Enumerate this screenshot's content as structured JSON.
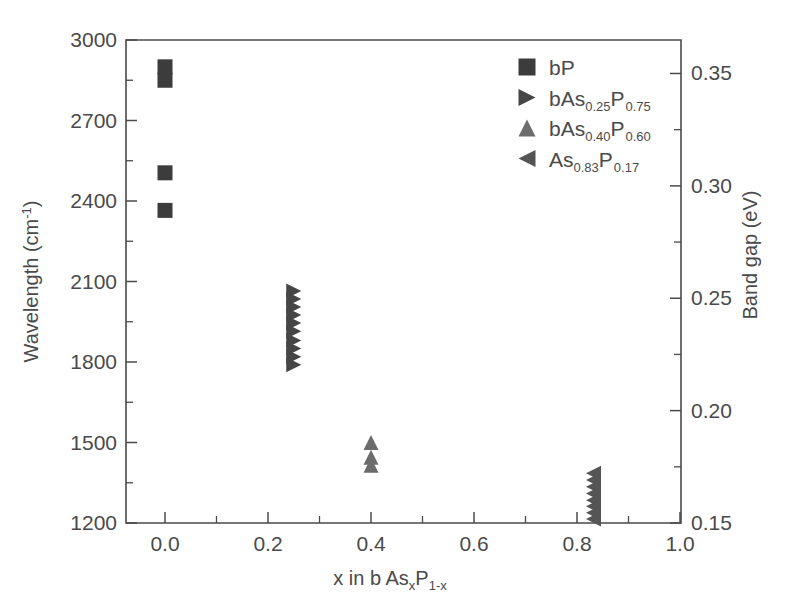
{
  "chart_data": {
    "type": "scatter",
    "title": "",
    "xlabel": "x in b As_xP_1-x",
    "xlabel_parts": {
      "prefix": "x in b As",
      "sub1": "x",
      "mid": "P",
      "sub2": "1-x"
    },
    "ylabel_left": "Wavelength (cm-1)",
    "ylabel_left_parts": {
      "text": "Wavelength (cm",
      "sup": "-1",
      "tail": ")"
    },
    "ylabel_right": "Band gap (eV)",
    "xlim": [
      0.0,
      1.0
    ],
    "ylim_left": [
      1200,
      3000
    ],
    "ylim_right": [
      0.15,
      0.3649
    ],
    "xticks": [
      "0.0",
      "0.2",
      "0.4",
      "0.6",
      "0.8",
      "1.0"
    ],
    "xtick_values": [
      0.0,
      0.2,
      0.4,
      0.6,
      0.8,
      1.0
    ],
    "yticks_left": [
      "3000",
      "2700",
      "2400",
      "2100",
      "1800",
      "1500",
      "1200"
    ],
    "ytick_values_left": [
      3000,
      2700,
      2400,
      2100,
      1800,
      1500,
      1200
    ],
    "yticks_right": [
      "0.35",
      "0.30",
      "0.25",
      "0.20",
      "0.15"
    ],
    "ytick_values_right": [
      0.35,
      0.3,
      0.25,
      0.2,
      0.15
    ],
    "minor_ticks_left": [
      2850,
      2550,
      2250,
      1950,
      1650,
      1350
    ],
    "minor_ticks_right": [
      0.325,
      0.275,
      0.225,
      0.175
    ],
    "minor_ticks_x": [
      0.1,
      0.3,
      0.5,
      0.7,
      0.9
    ],
    "grid": false,
    "legend_position": "top-right",
    "series": [
      {
        "name": "bP",
        "marker": "square",
        "color": "#3c3c3c",
        "size": 15,
        "points": [
          {
            "x": 0.0,
            "y": 2900
          },
          {
            "x": 0.0,
            "y": 2850
          },
          {
            "x": 0.0,
            "y": 2505
          },
          {
            "x": 0.0,
            "y": 2365
          }
        ]
      },
      {
        "name": "bAs0.25P0.75",
        "marker": "triangle-right",
        "color": "#464646",
        "size": 15,
        "points": [
          {
            "x": 0.25,
            "y": 2065
          },
          {
            "x": 0.25,
            "y": 2035
          },
          {
            "x": 0.25,
            "y": 2005
          },
          {
            "x": 0.25,
            "y": 1975
          },
          {
            "x": 0.25,
            "y": 1945
          },
          {
            "x": 0.25,
            "y": 1915
          },
          {
            "x": 0.25,
            "y": 1880
          },
          {
            "x": 0.25,
            "y": 1850
          },
          {
            "x": 0.25,
            "y": 1820
          },
          {
            "x": 0.25,
            "y": 1790
          }
        ]
      },
      {
        "name": "bAs0.40P0.60",
        "marker": "triangle-up",
        "color": "#6c6c6c",
        "size": 15,
        "points": [
          {
            "x": 0.4,
            "y": 1500
          },
          {
            "x": 0.4,
            "y": 1445
          },
          {
            "x": 0.4,
            "y": 1415
          }
        ]
      },
      {
        "name": "As0.83P0.17",
        "marker": "triangle-left",
        "color": "#555555",
        "size": 15,
        "points": [
          {
            "x": 0.832,
            "y": 1385
          },
          {
            "x": 0.832,
            "y": 1360
          },
          {
            "x": 0.832,
            "y": 1335
          },
          {
            "x": 0.832,
            "y": 1310
          },
          {
            "x": 0.832,
            "y": 1285
          },
          {
            "x": 0.832,
            "y": 1262
          },
          {
            "x": 0.832,
            "y": 1238
          },
          {
            "x": 0.832,
            "y": 1215
          }
        ]
      }
    ],
    "legend": [
      {
        "label_prefix": "bP",
        "sub1": "",
        "label_mid": "",
        "sub2": "",
        "marker": "square",
        "color": "#3c3c3c"
      },
      {
        "label_prefix": "bAs",
        "sub1": "0.25",
        "label_mid": "P",
        "sub2": "0.75",
        "marker": "triangle-right",
        "color": "#464646"
      },
      {
        "label_prefix": "bAs",
        "sub1": "0.40",
        "label_mid": "P",
        "sub2": "0.60",
        "marker": "triangle-up",
        "color": "#6c6c6c"
      },
      {
        "label_prefix": "As",
        "sub1": "0.83",
        "label_mid": "P",
        "sub2": "0.17",
        "marker": "triangle-left",
        "color": "#555555"
      }
    ]
  },
  "colors": {
    "axis": "#4a4a4a",
    "text": "#4a4a4a",
    "background": "#ffffff"
  }
}
